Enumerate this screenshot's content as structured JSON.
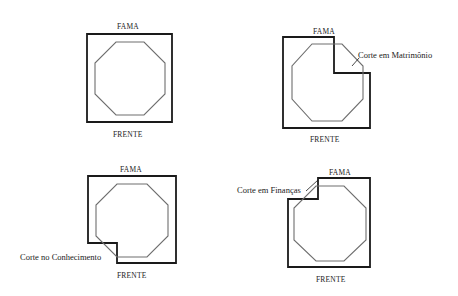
{
  "colors": {
    "frame": "#1a1a1a",
    "octagon": "#6e6e6e",
    "text": "#222222",
    "background": "#ffffff"
  },
  "diagrams": [
    {
      "id": "intact",
      "top_label": "FAMA",
      "bottom_label": "FRENTE",
      "cut_label": ""
    },
    {
      "id": "matrimonio",
      "top_label": "FAMA",
      "bottom_label": "FRENTE",
      "cut_label": "Corte em Matrimônio"
    },
    {
      "id": "conhecimento",
      "top_label": "FAMA",
      "bottom_label": "FRENTE",
      "cut_label": "Corte no Conhecimento"
    },
    {
      "id": "financas",
      "top_label": "FAMA",
      "bottom_label": "FRENTE",
      "cut_label": "Corte em Finanças"
    }
  ]
}
